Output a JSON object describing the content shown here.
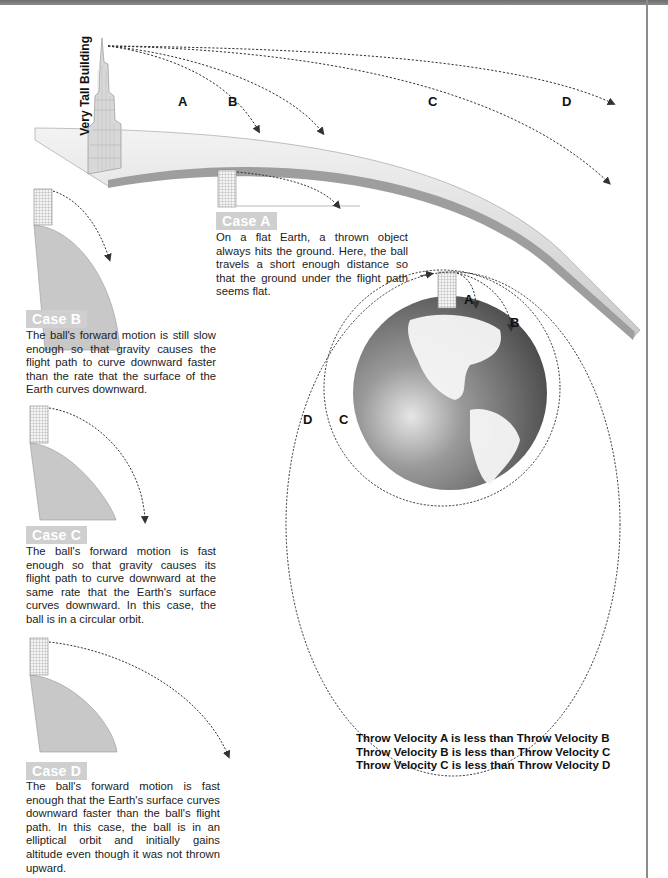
{
  "diagram": {
    "building_label": "Very Tall Building",
    "trajectory_labels": [
      "A",
      "B",
      "C",
      "D"
    ],
    "globe_labels": {
      "A": "A",
      "B": "B",
      "C": "C",
      "D": "D"
    },
    "colors": {
      "case_label_bg": "#cfcfcf",
      "earth_section_fill": "#c8c8c8",
      "trajectory_dash": "#333333",
      "globe_dark": "#555555",
      "globe_light": "#d9d9d9"
    }
  },
  "cases": [
    {
      "label": "Case A",
      "text": "On a flat Earth, a thrown object always hits the ground. Here, the ball travels a short enough distance so that the ground under the flight path seems flat."
    },
    {
      "label": "Case B",
      "text": "The ball's forward motion is still slow enough so that gravity causes the flight path to curve downward faster than the rate that the surface of the Earth curves downward."
    },
    {
      "label": "Case C",
      "text": "The ball's forward motion is fast enough so that gravity causes its flight path to curve downward at the same rate that the Earth's surface curves downward. In this case, the ball is in a circular orbit."
    },
    {
      "label": "Case D",
      "text": "The ball's forward motion is fast enough that the Earth's surface curves downward faster than the ball's flight path. In this case, the ball is in an elliptical orbit and initially gains altitude even though it was not thrown upward."
    }
  ],
  "summary": [
    "Throw Velocity A is less than Throw Velocity B",
    "Throw Velocity B is less than Throw Velocity C",
    "Throw Velocity C is less than Throw Velocity D"
  ]
}
